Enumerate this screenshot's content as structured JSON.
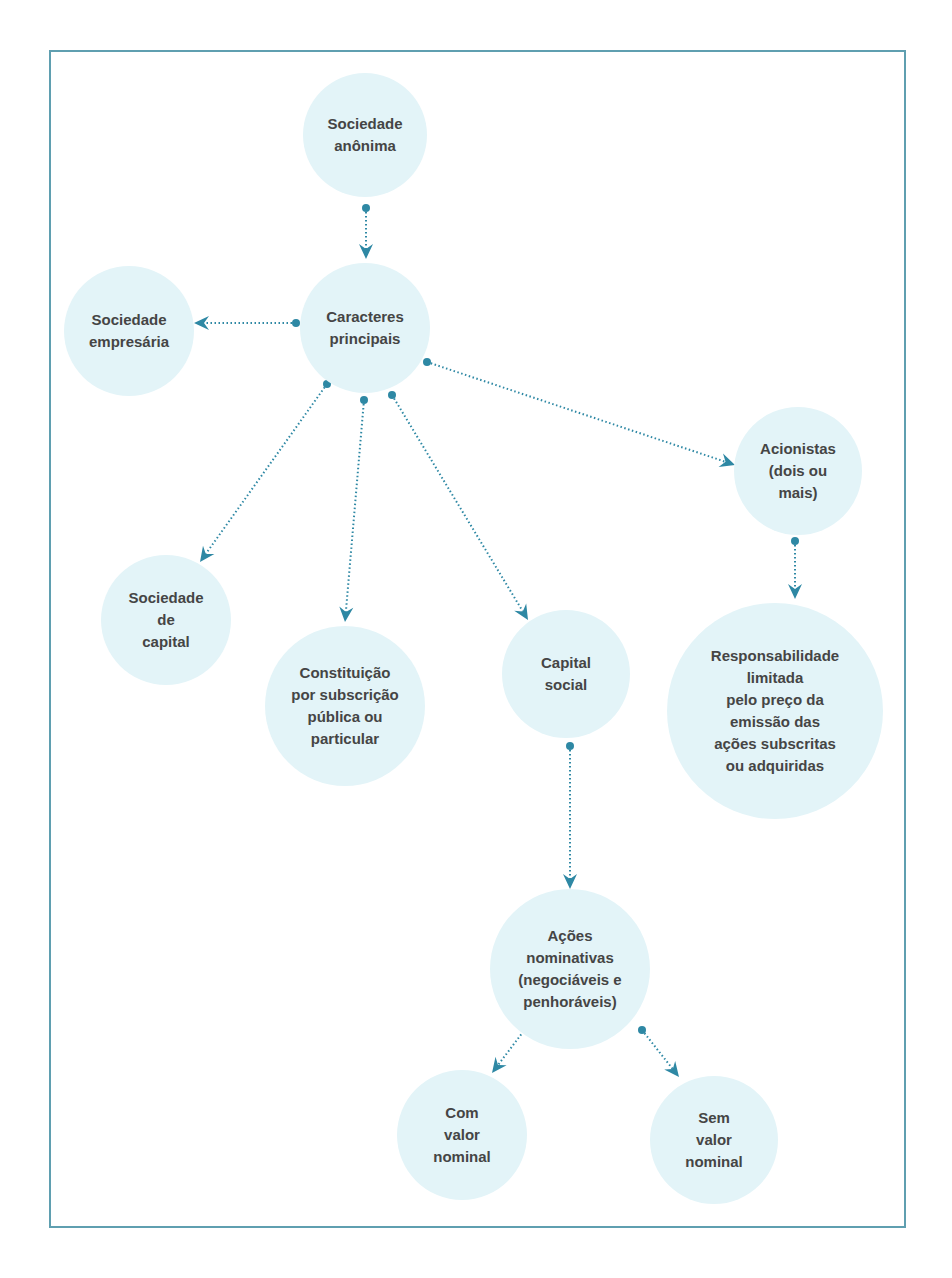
{
  "diagram": {
    "colors": {
      "frame_border": "#5f9fb0",
      "node_fill": "#e3f4f8",
      "node_text": "#454545",
      "connector": "#2e88a4"
    },
    "nodes": [
      {
        "id": "sociedade-anonima",
        "label": "Sociedade\nanônima",
        "cx": 365,
        "cy": 135,
        "r": 62
      },
      {
        "id": "caracteres-principais",
        "label": "Caracteres\nprincipais",
        "cx": 365,
        "cy": 328,
        "r": 65
      },
      {
        "id": "sociedade-empresaria",
        "label": "Sociedade\nempresária",
        "cx": 129,
        "cy": 331,
        "r": 65
      },
      {
        "id": "acionistas",
        "label": "Acionistas\n(dois ou\nmais)",
        "cx": 798,
        "cy": 471,
        "r": 64
      },
      {
        "id": "responsabilidade-limitada",
        "label": "Responsabilidade\nlimitada\npelo preço da\nemissão das\nações subscritas\nou adquiridas",
        "cx": 775,
        "cy": 711,
        "r": 108
      },
      {
        "id": "sociedade-de-capital",
        "label": "Sociedade\nde\ncapital",
        "cx": 166,
        "cy": 620,
        "r": 65
      },
      {
        "id": "constituicao",
        "label": "Constituição\npor subscrição\npública ou\nparticular",
        "cx": 345,
        "cy": 706,
        "r": 80
      },
      {
        "id": "capital-social",
        "label": "Capital\nsocial",
        "cx": 566,
        "cy": 674,
        "r": 64
      },
      {
        "id": "acoes-nominativas",
        "label": "Ações\nnominativas\n(negociáveis e\npenhoráveis)",
        "cx": 570,
        "cy": 969,
        "r": 80
      },
      {
        "id": "com-valor-nominal",
        "label": "Com\nvalor\nnominal",
        "cx": 462,
        "cy": 1135,
        "r": 65
      },
      {
        "id": "sem-valor-nominal",
        "label": "Sem\nvalor\nnominal",
        "cx": 714,
        "cy": 1140,
        "r": 64
      }
    ],
    "edges": [
      {
        "from": "sociedade-anonima",
        "to": "caracteres-principais",
        "x1": 366,
        "y1": 208,
        "x2": 366,
        "y2": 259
      },
      {
        "from": "caracteres-principais",
        "to": "sociedade-empresaria",
        "x1": 296,
        "y1": 323,
        "x2": 194,
        "y2": 323
      },
      {
        "from": "caracteres-principais",
        "to": "acionistas",
        "x1": 427,
        "y1": 362,
        "x2": 735,
        "y2": 465
      },
      {
        "from": "caracteres-principais",
        "to": "sociedade-de-capital",
        "x1": 327,
        "y1": 384,
        "x2": 200,
        "y2": 562
      },
      {
        "from": "caracteres-principais",
        "to": "constituicao",
        "x1": 364,
        "y1": 400,
        "x2": 345,
        "y2": 622
      },
      {
        "from": "caracteres-principais",
        "to": "capital-social",
        "x1": 392,
        "y1": 395,
        "x2": 528,
        "y2": 620
      },
      {
        "from": "acionistas",
        "to": "responsabilidade-limitada",
        "x1": 795,
        "y1": 541,
        "x2": 795,
        "y2": 599
      },
      {
        "from": "capital-social",
        "to": "acoes-nominativas",
        "x1": 570,
        "y1": 746,
        "x2": 570,
        "y2": 889
      },
      {
        "from": "acoes-nominativas",
        "to": "com-valor-nominal",
        "x1": 526,
        "y1": 1028,
        "x2": 492,
        "y2": 1073
      },
      {
        "from": "acoes-nominativas",
        "to": "sem-valor-nominal",
        "x1": 642,
        "y1": 1030,
        "x2": 679,
        "y2": 1077
      }
    ]
  }
}
